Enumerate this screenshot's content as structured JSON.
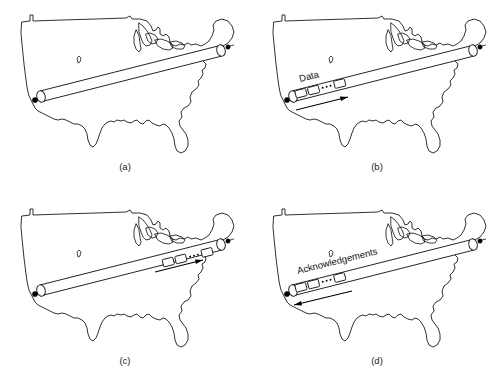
{
  "figure": {
    "background_color": "#ffffff",
    "ink_color": "#1a1a1a",
    "panel_count": 4
  },
  "panels": [
    {
      "id": "a",
      "caption": "(a)",
      "pipe_label": "",
      "state": "empty-pipe",
      "packets_visible": 0,
      "arrow": "none",
      "arrow_direction": ""
    },
    {
      "id": "b",
      "caption": "(b)",
      "pipe_label": "Data",
      "state": "data-entering-pipe",
      "packets_visible": 3,
      "arrow": "yes",
      "arrow_direction": "west-to-east"
    },
    {
      "id": "c",
      "caption": "(c)",
      "pipe_label": "",
      "state": "data-arriving-at-receiver",
      "packets_visible": 3,
      "arrow": "yes",
      "arrow_direction": "west-to-east"
    },
    {
      "id": "d",
      "caption": "(d)",
      "pipe_label": "Acknowledgements",
      "state": "acknowledgements-returning",
      "packets_visible": 3,
      "arrow": "yes",
      "arrow_direction": "east-to-west"
    }
  ],
  "endpoints": {
    "west_label": "",
    "east_label": "",
    "west_marker": "host-dot",
    "east_marker": "host-dot"
  },
  "icons": {
    "host_dot": "filled-circle",
    "packet": "rectangle",
    "ellipsis": "three-dots",
    "flow_arrow": "arrow"
  },
  "colors": {
    "page_background": "#ffffff",
    "line": "#1a1a1a",
    "marker": "#000000",
    "packet_fill": "#ffffff"
  }
}
